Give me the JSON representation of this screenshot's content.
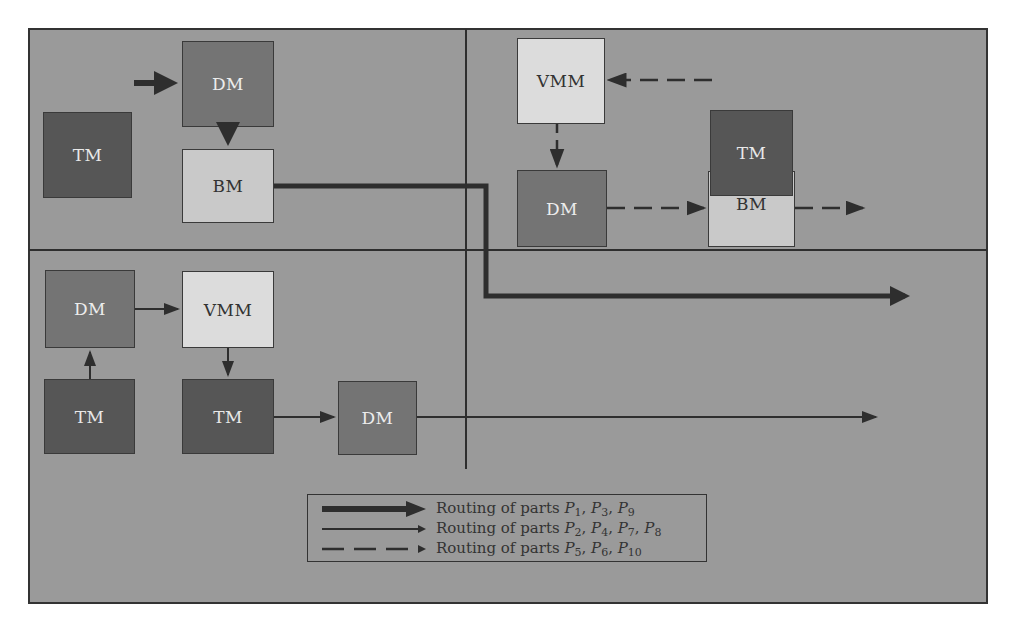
{
  "zones": [
    {
      "id": "top-left"
    },
    {
      "id": "top-right"
    },
    {
      "id": "bottom-left"
    },
    {
      "id": "bottom-right"
    }
  ],
  "machines": {
    "top_left": {
      "tm": {
        "label": "TM"
      },
      "dm": {
        "label": "DM"
      },
      "bm": {
        "label": "BM"
      }
    },
    "top_right": {
      "vmm": {
        "label": "VMM"
      },
      "dm": {
        "label": "DM"
      },
      "tm": {
        "label": "TM"
      },
      "bm": {
        "label": "BM"
      }
    },
    "bottom_left": {
      "dm1": {
        "label": "DM"
      },
      "vmm": {
        "label": "VMM"
      },
      "tm1": {
        "label": "TM"
      },
      "tm2": {
        "label": "TM"
      },
      "dm2": {
        "label": "DM"
      }
    }
  },
  "legend": {
    "rows": [
      {
        "style": "thick-solid",
        "prefix": "Routing of parts ",
        "parts": [
          {
            "p": "P",
            "sub": "1"
          },
          {
            "p": "P",
            "sub": "3"
          },
          {
            "p": "P",
            "sub": "9"
          }
        ],
        "text": "Routing of parts P1, P3, P9"
      },
      {
        "style": "thin-solid",
        "prefix": "Routing of parts ",
        "parts": [
          {
            "p": "P",
            "sub": "2"
          },
          {
            "p": "P",
            "sub": "4"
          },
          {
            "p": "P",
            "sub": "7"
          },
          {
            "p": "P",
            "sub": "8"
          }
        ],
        "text": "Routing of parts P2, P4, P7, P8"
      },
      {
        "style": "dashed",
        "prefix": "Routing of parts ",
        "parts": [
          {
            "p": "P",
            "sub": "5"
          },
          {
            "p": "P",
            "sub": "6"
          },
          {
            "p": "P",
            "sub": "10"
          }
        ],
        "text": "Routing of parts P5, P6, P10"
      }
    ]
  },
  "colors": {
    "background": "#9a9a9a",
    "tm": "#565656",
    "dm": "#747474",
    "bm": "#c9c9c9",
    "vmm": "#dcdcdc",
    "line": "#2e2e2e"
  }
}
